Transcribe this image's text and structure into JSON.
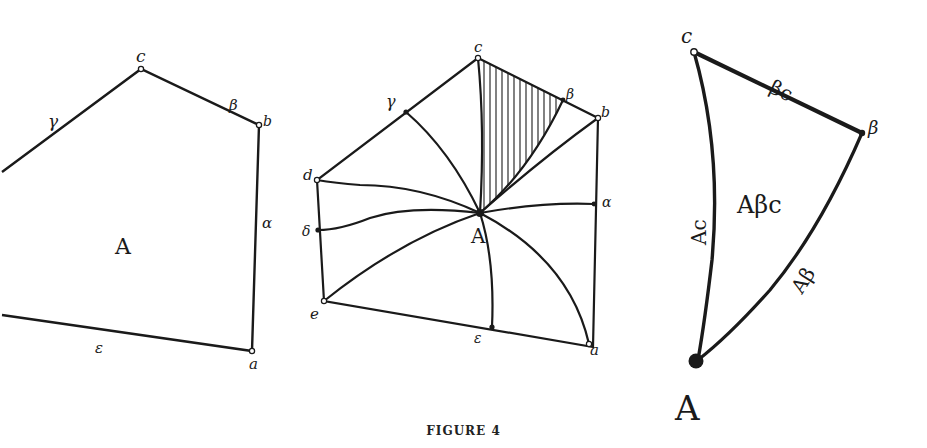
{
  "caption": "FIGURE 4",
  "panels": [
    {
      "id": "left-polygon",
      "region_label": "A",
      "vertex_labels": {
        "c": "c",
        "b": "b",
        "a": "a"
      },
      "edge_labels": {
        "gamma": "γ",
        "beta": "β",
        "alpha": "α",
        "epsilon": "ε"
      }
    },
    {
      "id": "subdivided-polygon",
      "center_label": "A",
      "vertex_labels": {
        "c": "c",
        "b": "b",
        "a": "a",
        "d": "d",
        "e": "e"
      },
      "edge_labels": {
        "gamma": "γ",
        "beta": "β",
        "alpha": "α",
        "delta": "δ",
        "epsilon": "ε"
      }
    },
    {
      "id": "triangle-detail",
      "vertex_labels": {
        "c": "c",
        "beta": "β",
        "A": "A"
      },
      "edge_labels": {
        "beta_c": "βc",
        "A_c": "Ac",
        "A_beta": "Aβ"
      },
      "region_label": "Aβc"
    }
  ]
}
